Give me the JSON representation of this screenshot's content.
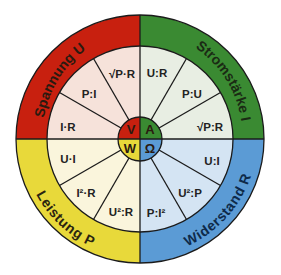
{
  "diagram": {
    "center": {
      "x": 140,
      "y": 139
    },
    "radii": {
      "outer": 124,
      "middle": 93,
      "inner": 22
    },
    "quadrants": [
      {
        "id": "voltage",
        "quantity_label": "Spannung U",
        "unit": "V",
        "ring_color": "#c8200f",
        "segment_color": "#f6e2da",
        "unit_color": "#c8200f",
        "start_angle": 180,
        "end_angle": 270,
        "formulas": [
          "I·R",
          "P:I",
          "√P·R"
        ]
      },
      {
        "id": "current",
        "quantity_label": "Stromstärke I",
        "unit": "A",
        "ring_color": "#3a8a32",
        "segment_color": "#e8eee3",
        "unit_color": "#3a8a32",
        "start_angle": 270,
        "end_angle": 360,
        "formulas": [
          "U:R",
          "P:U",
          "√P:R"
        ]
      },
      {
        "id": "resistance",
        "quantity_label": "Widerstand R",
        "unit": "Ω",
        "ring_color": "#5b9bd5",
        "segment_color": "#d4e4f3",
        "unit_color": "#5b9bd5",
        "start_angle": 0,
        "end_angle": 90,
        "formulas": [
          "U:I",
          "U²:P",
          "P:I²"
        ]
      },
      {
        "id": "power",
        "quantity_label": "Leistung P",
        "unit": "W",
        "ring_color": "#e8d93a",
        "segment_color": "#faf5dc",
        "unit_color": "#e8d93a",
        "start_angle": 90,
        "end_angle": 180,
        "formulas": [
          "U·I",
          "I²·R",
          "U²:R"
        ]
      }
    ],
    "text_color": "#2a1a10"
  }
}
